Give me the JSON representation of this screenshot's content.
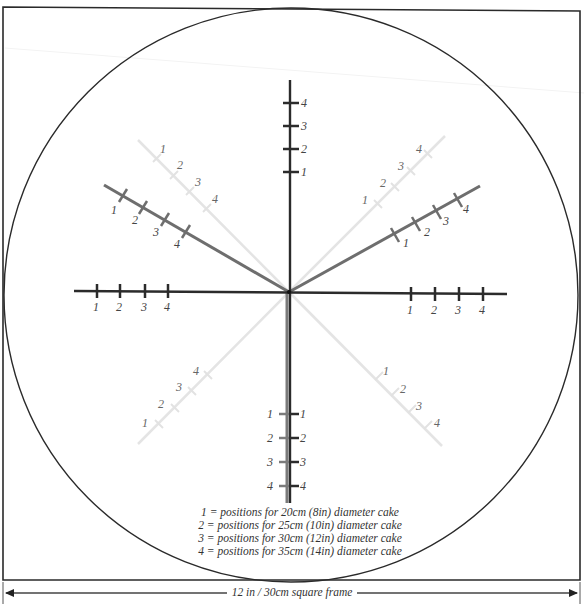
{
  "diagram": {
    "colors": {
      "outline": "#2a2a2a",
      "axis_dark": "#2b2b2b",
      "axis_mid": "#6e6e6e",
      "axis_light": "#e2e2e2",
      "label": "#444444"
    },
    "axes": {
      "top": {
        "labels": [
          "4",
          "3",
          "2",
          "1"
        ]
      },
      "bottom": {
        "labels_left": [
          "1",
          "2",
          "3",
          "4"
        ],
        "labels_right": [
          "1",
          "2",
          "3",
          "4"
        ]
      },
      "left": {
        "labels": [
          "1",
          "2",
          "3",
          "4"
        ]
      },
      "right": {
        "labels": [
          "1",
          "2",
          "3",
          "4"
        ]
      },
      "upper_left_dark": {
        "labels": [
          "1",
          "2",
          "3",
          "4"
        ]
      },
      "upper_right_dark": {
        "labels": [
          "1",
          "2",
          "3",
          "4"
        ]
      },
      "upper_left_light": {
        "labels": [
          "1",
          "2",
          "3",
          "4"
        ]
      },
      "upper_right_light": {
        "labels": [
          "1",
          "2",
          "3",
          "4"
        ]
      },
      "lower_left_light": {
        "labels": [
          "1",
          "2",
          "3",
          "4"
        ]
      },
      "lower_right_light": {
        "labels": [
          "1",
          "2",
          "3",
          "4"
        ]
      }
    },
    "legend": [
      "1 = positions for 20cm (8in) diameter cake",
      "2 = positions for 25cm (10in) diameter cake",
      "3 = positions for 30cm (12in) diameter cake",
      "4 = positions for 35cm (14in) diameter cake"
    ],
    "frame_caption": "12 in / 30cm  square frame"
  }
}
